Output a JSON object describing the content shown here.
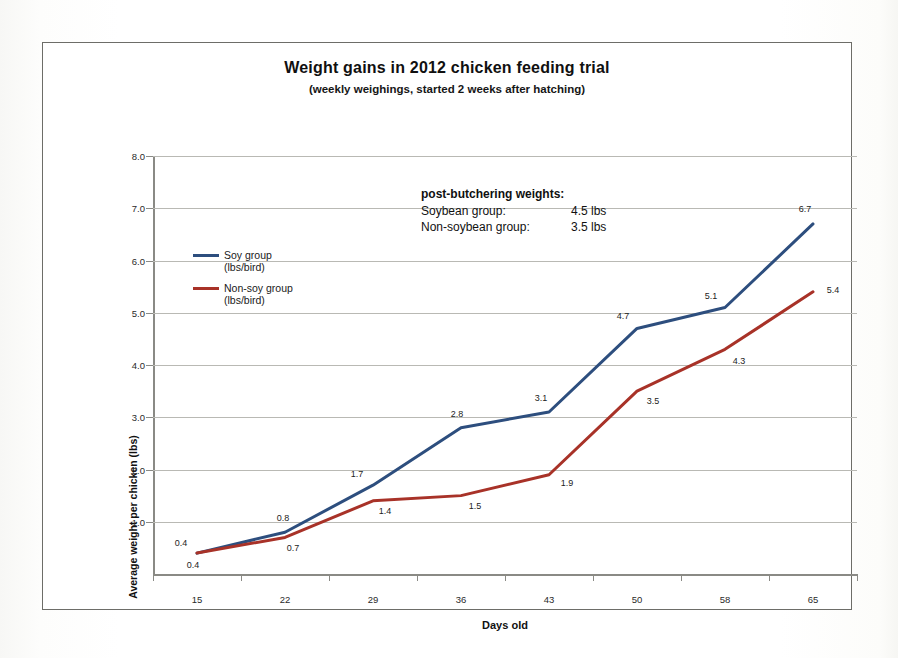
{
  "chart_data": {
    "type": "line",
    "title": "Weight gains in 2012 chicken feeding trial",
    "subtitle": "(weekly weighings, started 2 weeks after hatching)",
    "xlabel": "Days old",
    "ylabel": "Average weight per chicken (lbs)",
    "categories": [
      "15",
      "22",
      "29",
      "36",
      "43",
      "50",
      "58",
      "65"
    ],
    "ylim": [
      0,
      8.0
    ],
    "yticks": [
      "1.0",
      "2.0",
      "3.0",
      "4.0",
      "5.0",
      "6.0",
      "7.0",
      "8.0"
    ],
    "grid": true,
    "legend_position": "inside-upper-left",
    "series": [
      {
        "name": "Soy group",
        "sublabel": "(lbs/bird)",
        "color": "#2d4e7e",
        "values": [
          0.4,
          0.8,
          1.7,
          2.8,
          3.1,
          4.7,
          5.1,
          6.7
        ],
        "labels": [
          "0.4",
          "0.8",
          "1.7",
          "2.8",
          "3.1",
          "4.7",
          "5.1",
          "6.7"
        ]
      },
      {
        "name": "Non-soy group",
        "sublabel": "(lbs/bird)",
        "color": "#a83228",
        "values": [
          0.4,
          0.7,
          1.4,
          1.5,
          1.9,
          3.5,
          4.3,
          5.4
        ],
        "labels": [
          "0.4",
          "0.7",
          "1.4",
          "1.5",
          "1.9",
          "3.5",
          "4.3",
          "5.4"
        ]
      }
    ],
    "annotation": {
      "title": "post-butchering weights:",
      "rows": [
        {
          "name": "Soybean group:",
          "value": "4.5 lbs"
        },
        {
          "name": "Non-soybean group:",
          "value": "3.5 lbs"
        }
      ]
    }
  }
}
